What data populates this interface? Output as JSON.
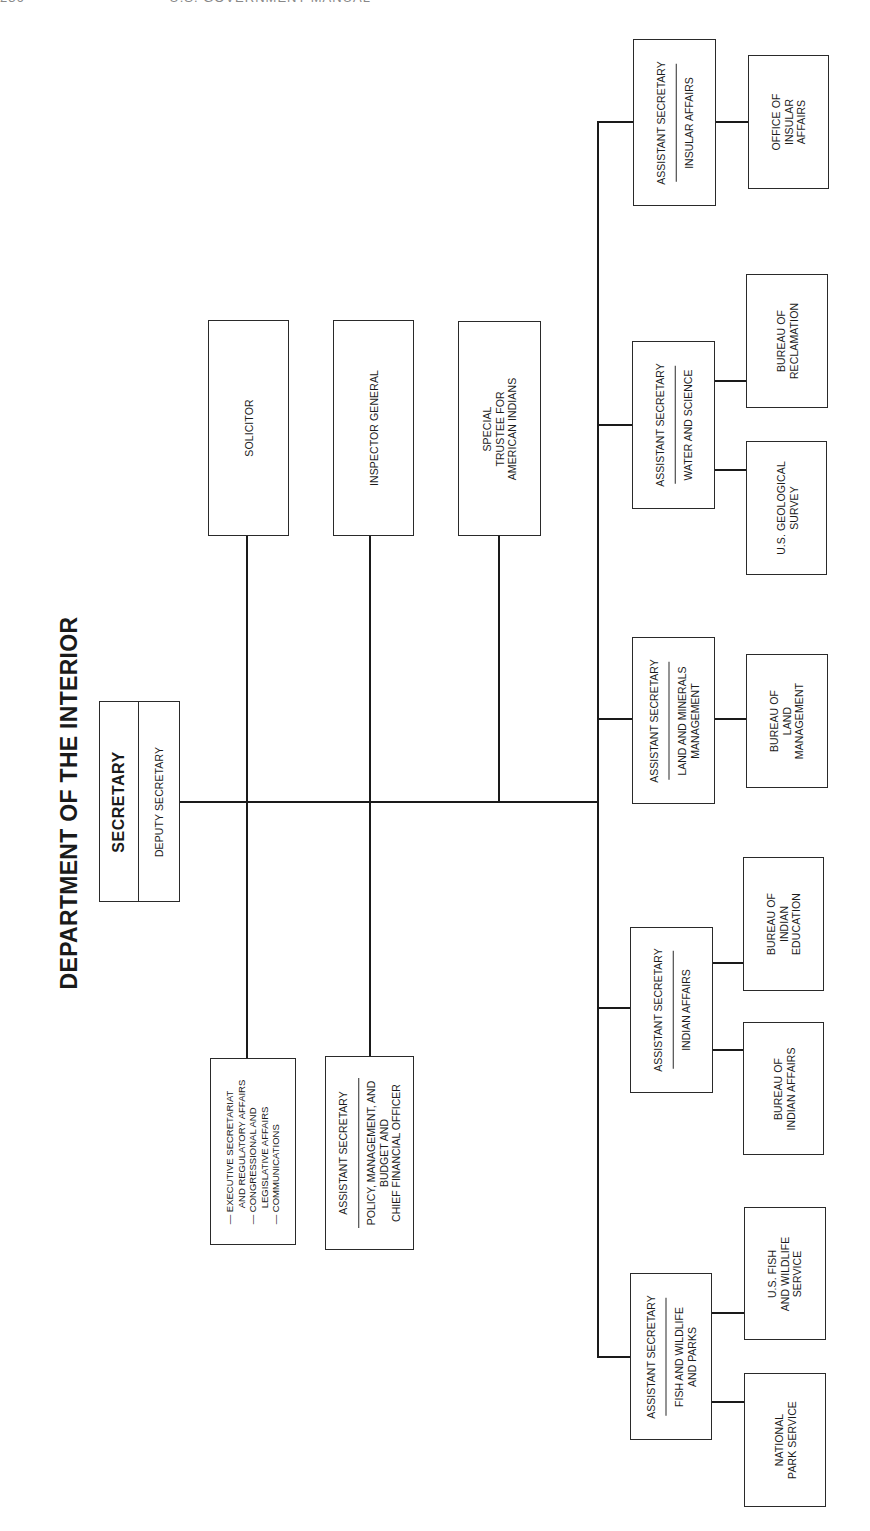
{
  "header": {
    "page_number": "236",
    "running_title": "U.S. GOVERNMENT MANUAL"
  },
  "title": "DEPARTMENT OF THE INTERIOR",
  "secretary": {
    "title": "SECRETARY",
    "deputy": "DEPUTY SECRETARY"
  },
  "staff_offices": {
    "solicitor": "SOLICITOR",
    "inspector_general": "INSPECTOR GENERAL",
    "special_trustee": [
      "SPECIAL",
      "TRUSTEE FOR",
      "AMERICAN INDIANS"
    ]
  },
  "executive_offices": {
    "items": [
      [
        "EXECUTIVE SECRETARIAT",
        "AND REGULATORY AFFAIRS"
      ],
      [
        "CONGRESSIONAL AND",
        "LEGISLATIVE AFFAIRS"
      ],
      [
        "COMMUNICATIONS"
      ]
    ],
    "bullet": "—"
  },
  "policy_office": {
    "role": "ASSISTANT SECRETARY",
    "area": [
      "POLICY, MANAGEMENT, AND",
      "BUDGET AND",
      "CHIEF FINANCIAL OFFICER"
    ]
  },
  "assistant_secretaries": [
    {
      "role": "ASSISTANT SECRETARY",
      "area": [
        "INSULAR AFFAIRS"
      ],
      "bureaus": [
        [
          "OFFICE OF",
          "INSULAR",
          "AFFAIRS"
        ]
      ]
    },
    {
      "role": "ASSISTANT SECRETARY",
      "area": [
        "WATER AND SCIENCE"
      ],
      "bureaus": [
        [
          "BUREAU OF",
          "RECLAMATION"
        ],
        [
          "U.S. GEOLOGICAL",
          "SURVEY"
        ]
      ]
    },
    {
      "role": "ASSISTANT SECRETARY",
      "area": [
        "LAND AND MINERALS",
        "MANAGEMENT"
      ],
      "bureaus": [
        [
          "BUREAU OF",
          "LAND",
          "MANAGEMENT"
        ]
      ]
    },
    {
      "role": "ASSISTANT SECRETARY",
      "area": [
        "INDIAN AFFAIRS"
      ],
      "bureaus": [
        [
          "BUREAU OF",
          "INDIAN",
          "EDUCATION"
        ],
        [
          "BUREAU OF",
          "INDIAN AFFAIRS"
        ]
      ]
    },
    {
      "role": "ASSISTANT SECRETARY",
      "area": [
        "FISH AND WILDLIFE",
        "AND PARKS"
      ],
      "bureaus": [
        [
          "U.S. FISH",
          "AND WILDLIFE",
          "SERVICE"
        ],
        [
          "NATIONAL",
          "PARK SERVICE"
        ]
      ]
    }
  ],
  "colors": {
    "line": "#1a1a1a",
    "border": "#2a2a2a",
    "background": "#ffffff"
  }
}
